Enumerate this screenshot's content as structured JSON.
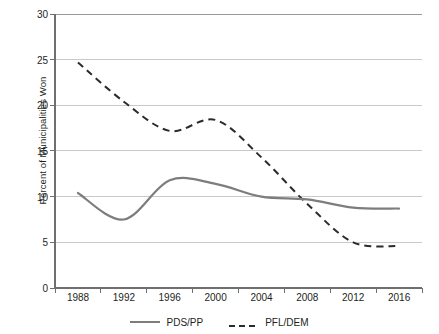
{
  "chart_data": {
    "type": "line",
    "title": "",
    "xlabel": "",
    "ylabel": "Percent of Municipalities Won",
    "ylim": [
      0,
      30
    ],
    "ytick_step": 5,
    "yticks": [
      0,
      5,
      10,
      15,
      20,
      25,
      30
    ],
    "grid": "horizontal",
    "legend_position": "bottom",
    "categories": [
      1988,
      1992,
      1996,
      2000,
      2004,
      2008,
      2012,
      2016
    ],
    "x": [
      1988,
      1992,
      1996,
      2000,
      2004,
      2008,
      2012,
      2016
    ],
    "series": [
      {
        "name": "PDS/PP",
        "style": "solid",
        "color": "#7d7d7d",
        "values": [
          10.4,
          7.5,
          11.8,
          11.4,
          10.0,
          9.7,
          8.8,
          8.7
        ]
      },
      {
        "name": "PFL/DEM",
        "style": "dashed",
        "color": "#2b2b2b",
        "values": [
          24.7,
          20.4,
          17.2,
          18.4,
          14.3,
          9.2,
          5.0,
          4.6
        ]
      }
    ]
  },
  "axes": {
    "y_title": "Percent of Municipalities Won",
    "y_tick_labels": [
      "30",
      "25",
      "20",
      "15",
      "10",
      "5",
      "0"
    ],
    "x_tick_labels": [
      "1988",
      "1992",
      "1996",
      "2000",
      "2004",
      "2008",
      "2012",
      "2016"
    ]
  },
  "legend": {
    "entries": [
      {
        "label": "PDS/PP",
        "style": "solid",
        "color": "#7d7d7d"
      },
      {
        "label": "PFL/DEM",
        "style": "dashed",
        "color": "#2b2b2b"
      }
    ]
  },
  "colors": {
    "axis": "#6f6f6f",
    "grid": "#c9c9c9",
    "text": "#231f20",
    "series_solid": "#7d7d7d",
    "series_dashed": "#2b2b2b",
    "background": "#ffffff"
  }
}
